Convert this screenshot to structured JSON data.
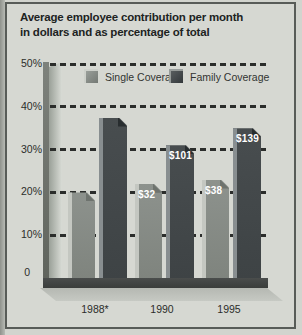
{
  "title": {
    "line1": "Average employee contribution per month",
    "line2": "in dollars and as percentage of total"
  },
  "legend": {
    "items": [
      {
        "label": "Single Coverage"
      },
      {
        "label": "Family Coverage"
      }
    ]
  },
  "y_axis": {
    "tick_labels": [
      "50%",
      "40%",
      "30%",
      "20%",
      "10%"
    ],
    "zero_label": "0"
  },
  "x_axis": {
    "categories": [
      "1988*",
      "1990",
      "1995"
    ]
  },
  "chart_data": {
    "type": "bar",
    "title": "Average employee contribution per month in dollars and as percentage of total",
    "categories": [
      "1988*",
      "1990",
      "1995"
    ],
    "y_unit": "percent of total",
    "ylim": [
      0,
      50
    ],
    "gridlines": "dashed horizontal every 10%",
    "legend_position": "top-inside",
    "series": [
      {
        "name": "Single Coverage",
        "values_percent": [
          20,
          22,
          23
        ],
        "dollar_labels": [
          "",
          "$32",
          "$38"
        ]
      },
      {
        "name": "Family Coverage",
        "values_percent": [
          37.5,
          31,
          35
        ],
        "dollar_labels": [
          "",
          "$101",
          "$139"
        ]
      }
    ]
  },
  "colors": {
    "page_bg": "#d2d4ce",
    "card_bg": "#d6d8d2",
    "card_border": "#585c58",
    "title_text": "#20231f",
    "axis_text": "#2b2d2a",
    "grid_dash": "#2b2d2b",
    "single_bar": "#8d928d",
    "single_highlight": "#c4c7c1",
    "single_facet": "#6e736e",
    "family_bar": "#3e4345",
    "family_highlight": "#888e90",
    "family_facet": "#282d2f",
    "bar_label_text": "#ffffff",
    "base_bar": "#3a3d3b",
    "floor_shadow": "#b5b8b2"
  }
}
